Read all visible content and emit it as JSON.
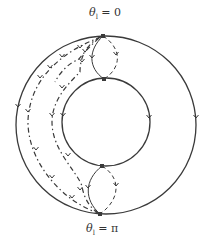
{
  "labels": {
    "top": {
      "symbol": "θ",
      "subscript": "l",
      "rest": " = 0"
    },
    "bottom": {
      "symbol": "θ",
      "subscript": "l",
      "rest": " = π"
    }
  },
  "colors": {
    "stroke": "#3a3a3a",
    "background": "#ffffff"
  },
  "geometry": {
    "outer_circle": {
      "cx": 106,
      "cy": 125,
      "rx": 90,
      "ry": 89
    },
    "inner_circle": {
      "cx": 106,
      "cy": 122,
      "r": 44
    },
    "nodes": [
      {
        "name": "outer-top-node",
        "x": 103,
        "y": 36
      },
      {
        "name": "inner-top-node",
        "x": 104,
        "y": 79
      },
      {
        "name": "inner-bottom-node",
        "x": 102,
        "y": 166
      },
      {
        "name": "outer-bottom-node",
        "x": 100,
        "y": 214
      }
    ],
    "arrows_on_circles": [
      {
        "name": "outer-left-arrow",
        "x": 18,
        "y": 107
      },
      {
        "name": "outer-right-arrow",
        "x": 196,
        "y": 118
      },
      {
        "name": "inner-left-arrow",
        "x": 63,
        "y": 116
      },
      {
        "name": "inner-right-arrow",
        "x": 149,
        "y": 118
      }
    ],
    "paths": [
      {
        "name": "top-solid-connector",
        "style": "solid",
        "d": "M103,36 C88,50 88,68 104,79",
        "arrow": {
          "x": 92,
          "y": 58
        }
      },
      {
        "name": "top-dashed-connector",
        "style": "dashed",
        "d": "M103,36 C122,48 122,68 104,79",
        "arrow": {
          "x": 116,
          "y": 55
        }
      },
      {
        "name": "bottom-solid-connector",
        "style": "solid",
        "d": "M102,166 C84,180 84,200 100,214",
        "arrow": {
          "x": 88,
          "y": 188
        }
      },
      {
        "name": "bottom-dashed-connector",
        "style": "dashed",
        "d": "M102,166 C122,178 120,200 100,214",
        "arrow": {
          "x": 116,
          "y": 186
        }
      },
      {
        "name": "outer-dash-dot-trajectory",
        "style": "dashdot",
        "d": "M101,37 C60,52 30,80 28,120 C27,160 60,200 98,213",
        "arrows": [
          {
            "x": 62,
            "y": 57
          },
          {
            "x": 40,
            "y": 78
          },
          {
            "x": 28,
            "y": 112
          },
          {
            "x": 36,
            "y": 150
          },
          {
            "x": 52,
            "y": 178
          },
          {
            "x": 72,
            "y": 198
          }
        ]
      },
      {
        "name": "middle-dash-dot-trajectory",
        "style": "dashdot",
        "d": "M100,37 C84,46 80,60 80,72 C68,84 52,100 52,122 C52,150 76,170 82,186 C84,200 92,210 99,213",
        "arrows": [
          {
            "x": 85,
            "y": 52
          },
          {
            "x": 82,
            "y": 62
          },
          {
            "x": 62,
            "y": 88
          },
          {
            "x": 52,
            "y": 116
          },
          {
            "x": 68,
            "y": 156
          },
          {
            "x": 80,
            "y": 190
          }
        ]
      },
      {
        "name": "inner-dash-dot-trajectory",
        "style": "dashdot",
        "d": "M99,38 C88,48 82,55 78,60 C70,62 60,72 55,82",
        "arrows": [
          {
            "x": 80,
            "y": 48
          },
          {
            "x": 50,
            "y": 68
          }
        ]
      }
    ]
  }
}
